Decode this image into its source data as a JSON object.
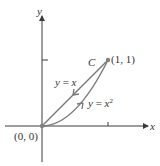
{
  "diagram": {
    "axes": {
      "x_label": "x",
      "y_label": "y"
    },
    "points": {
      "origin_label": "(0, 0)",
      "end_label": "(1, 1)"
    },
    "curve_name": "C",
    "paths": [
      {
        "label_lhs": "y = ",
        "label_rhs": "x",
        "direction": "from (1,1) to (0,0)"
      },
      {
        "label_lhs": "y = ",
        "label_rhs": "x",
        "superscript": "2",
        "direction": "from (0,0) to (1,1)"
      }
    ],
    "colors": {
      "axis": "#3a3a3a",
      "curve": "#7a7a7a",
      "point": "#808080",
      "text": "#333333"
    }
  }
}
